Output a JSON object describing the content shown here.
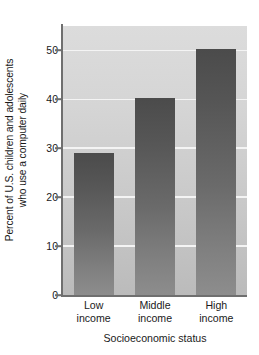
{
  "chart_data": {
    "type": "bar",
    "title": "",
    "subtitle": "",
    "xlabel": "Socioeconomic status",
    "ylabel": "Percent of U.S. children and adolescents who use a computer daily",
    "ylabel_lines": [
      "Percent of U.S. children and adolescents",
      "who use a computer daily"
    ],
    "categories": [
      "Low income",
      "Middle income",
      "High income"
    ],
    "category_lines": [
      [
        "Low",
        "income"
      ],
      [
        "Middle",
        "income"
      ],
      [
        "High",
        "income"
      ]
    ],
    "values": [
      29,
      40.2,
      50.3
    ],
    "ylim": [
      0,
      55
    ],
    "yticks": [
      0,
      10,
      20,
      30,
      40,
      50
    ],
    "ytick_labels": [
      "0",
      "10",
      "20",
      "30",
      "40",
      "50"
    ],
    "grid": true,
    "grid_axis": "y",
    "legend": "none",
    "colors": {
      "bar_top": "#4b4b4b",
      "bar_bottom": "#8d8d8d",
      "plot_background_top": "#dcdcdc",
      "plot_background_bottom": "#bbbbbb",
      "gridline": "#f4f4f4",
      "axis": "#6f6f6f",
      "text": "#1a1a1a",
      "page_background": "#ffffff"
    }
  }
}
